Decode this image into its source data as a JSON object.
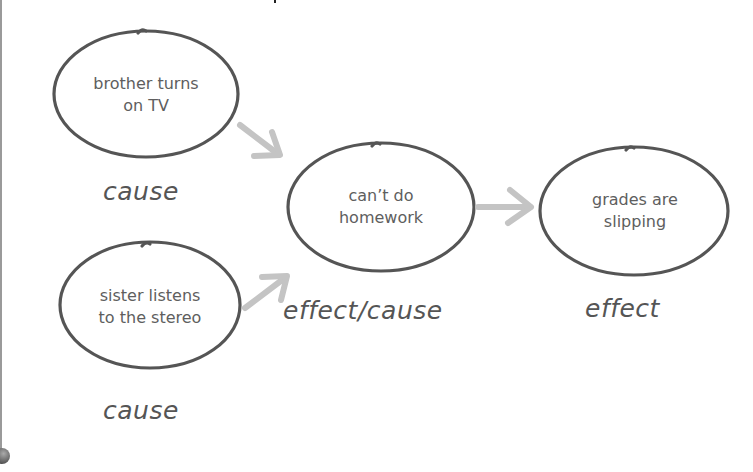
{
  "diagram": {
    "nodes": [
      {
        "id": "brother",
        "text_line1": "brother turns",
        "text_line2": "on TV",
        "label": "cause"
      },
      {
        "id": "sister",
        "text_line1": "sister listens",
        "text_line2": "to the stereo",
        "label": "cause"
      },
      {
        "id": "homework",
        "text_line1": "can’t do",
        "text_line2": "homework",
        "label": "effect/cause"
      },
      {
        "id": "grades",
        "text_line1": "grades are",
        "text_line2": "slipping",
        "label": "effect"
      }
    ],
    "edges": [
      {
        "from": "brother",
        "to": "homework"
      },
      {
        "from": "sister",
        "to": "homework"
      },
      {
        "from": "homework",
        "to": "grades"
      }
    ],
    "colors": {
      "outline": "#555555",
      "arrow": "#c4c4c4",
      "text": "#5e5e5e"
    }
  }
}
